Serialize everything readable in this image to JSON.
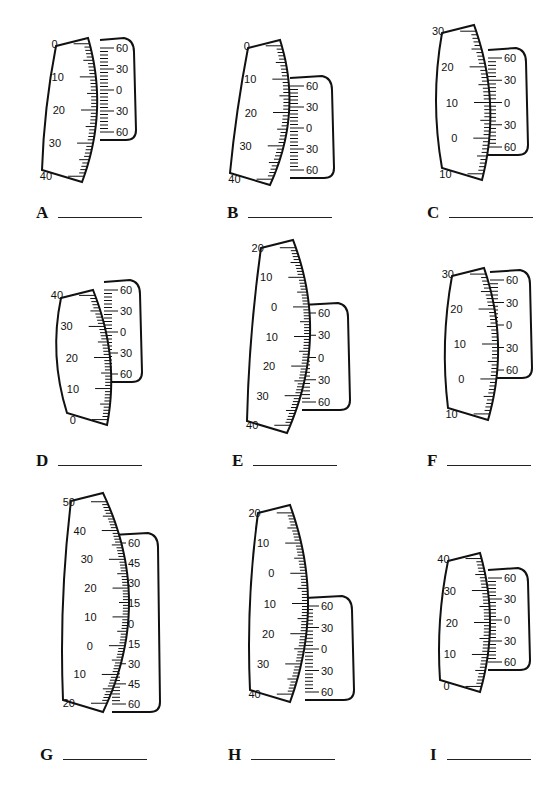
{
  "worksheet": {
    "items": [
      {
        "letter": "A",
        "main": {
          "labels": [
            "0",
            "10",
            "20",
            "30",
            "40"
          ],
          "top": 38,
          "bottom": 182,
          "x": 85,
          "curve": -12,
          "dir": "down",
          "tilt": -6
        },
        "vernier": {
          "labels": [
            "60",
            "30",
            "0",
            "30",
            "60"
          ],
          "top": 40,
          "bottom": 140,
          "x": 100,
          "width": 32
        },
        "answer": {
          "x": 36,
          "y": 204
        }
      },
      {
        "letter": "B",
        "main": {
          "labels": [
            "0",
            "10",
            "20",
            "30",
            "40"
          ],
          "top": 40,
          "bottom": 185,
          "x": 275,
          "curve": -14,
          "dir": "down",
          "tilt": -10
        },
        "vernier": {
          "labels": [
            "60",
            "30",
            "0",
            "30",
            "60"
          ],
          "top": 78,
          "bottom": 178,
          "x": 290,
          "width": 40
        },
        "answer": {
          "x": 227,
          "y": 204
        }
      },
      {
        "letter": "C",
        "main": {
          "labels": [
            "30",
            "20",
            "10",
            "0",
            "10"
          ],
          "top": 25,
          "bottom": 180,
          "x": 478,
          "curve": -12,
          "dir": "down",
          "tilt": 8
        },
        "vernier": {
          "labels": [
            "60",
            "30",
            "0",
            "30",
            "60"
          ],
          "top": 50,
          "bottom": 155,
          "x": 488,
          "width": 36
        },
        "answer": {
          "x": 427,
          "y": 204
        }
      },
      {
        "letter": "D",
        "main": {
          "labels": [
            "40",
            "30",
            "20",
            "10",
            "0"
          ],
          "top": 290,
          "bottom": 425,
          "x": 100,
          "curve": -10,
          "dir": "down",
          "tilt": 14
        },
        "vernier": {
          "labels": [
            "60",
            "30",
            "0",
            "30",
            "60"
          ],
          "top": 282,
          "bottom": 382,
          "x": 104,
          "width": 34
        },
        "answer": {
          "x": 36,
          "y": 452
        }
      },
      {
        "letter": "E",
        "main": {
          "labels": [
            "20",
            "10",
            "0",
            "10",
            "20",
            "30",
            "40"
          ],
          "top": 240,
          "bottom": 433,
          "x": 290,
          "curve": -20,
          "dir": "down",
          "tilt": -6
        },
        "vernier": {
          "labels": [
            "60",
            "30",
            "0",
            "30",
            "60"
          ],
          "top": 305,
          "bottom": 410,
          "x": 302,
          "width": 44
        },
        "answer": {
          "x": 232,
          "y": 452
        }
      },
      {
        "letter": "F",
        "main": {
          "labels": [
            "30",
            "20",
            "10",
            "0",
            "10"
          ],
          "top": 268,
          "bottom": 420,
          "x": 486,
          "curve": -12,
          "dir": "down",
          "tilt": 4
        },
        "vernier": {
          "labels": [
            "60",
            "30",
            "0",
            "30",
            "60"
          ],
          "top": 272,
          "bottom": 378,
          "x": 490,
          "width": 38
        },
        "answer": {
          "x": 427,
          "y": 452
        }
      },
      {
        "letter": "G",
        "main": {
          "labels": [
            "50",
            "40",
            "30",
            "20",
            "10",
            "0",
            "10",
            "20"
          ],
          "top": 493,
          "bottom": 712,
          "x": 103,
          "curve": -26,
          "dir": "down",
          "tilt": 0
        },
        "vernier": {
          "labels": [
            "60",
            "45",
            "30",
            "15",
            "0",
            "15",
            "30",
            "45",
            "60"
          ],
          "top": 535,
          "bottom": 712,
          "x": 112,
          "width": 44
        },
        "answer": {
          "x": 40,
          "y": 746
        }
      },
      {
        "letter": "H",
        "main": {
          "labels": [
            "20",
            "10",
            "0",
            "10",
            "20",
            "30",
            "40"
          ],
          "top": 505,
          "bottom": 702,
          "x": 290,
          "curve": -18,
          "dir": "down",
          "tilt": 0
        },
        "vernier": {
          "labels": [
            "60",
            "30",
            "0",
            "30",
            "60"
          ],
          "top": 598,
          "bottom": 700,
          "x": 305,
          "width": 45
        },
        "answer": {
          "x": 228,
          "y": 746
        }
      },
      {
        "letter": "I",
        "main": {
          "labels": [
            "40",
            "30",
            "20",
            "10",
            "0"
          ],
          "top": 553,
          "bottom": 692,
          "x": 480,
          "curve": -10,
          "dir": "down",
          "tilt": 0
        },
        "vernier": {
          "labels": [
            "60",
            "30",
            "0",
            "30",
            "60"
          ],
          "top": 570,
          "bottom": 670,
          "x": 488,
          "width": 38
        },
        "answer": {
          "x": 430,
          "y": 746
        }
      }
    ]
  },
  "colors": {
    "ink": "#111111",
    "paper": "#ffffff"
  }
}
